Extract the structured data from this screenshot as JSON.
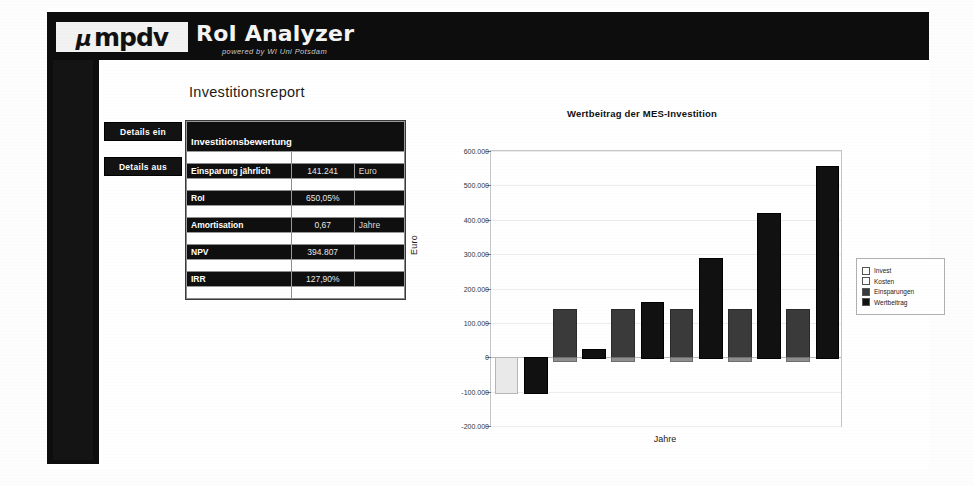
{
  "header": {
    "logo_mu": "µ",
    "logo_text": "mpdv",
    "app_title": "RoI Analyzer",
    "app_subtitle": "powered by WI Uni Potsdam"
  },
  "report": {
    "heading": "Investitionsreport"
  },
  "buttons": {
    "details_on": "Details ein",
    "details_off": "Details aus"
  },
  "table": {
    "title": "Investitionsbewertung",
    "rows": [
      {
        "label": "Einsparung jährlich",
        "value": "141.241",
        "unit": "Euro"
      },
      {
        "label": "RoI",
        "value": "650,05%",
        "unit": ""
      },
      {
        "label": "Amortisation",
        "value": "0,67",
        "unit": "Jahre"
      },
      {
        "label": "NPV",
        "value": "394.807",
        "unit": ""
      },
      {
        "label": "IRR",
        "value": "127,90%",
        "unit": ""
      }
    ]
  },
  "chart_data": {
    "type": "bar",
    "title": "Wertbeitrag der MES-Investition",
    "xlabel": "Jahre",
    "ylabel": "Euro",
    "ylim": [
      -200000,
      600000
    ],
    "ytick_values": [
      -200000,
      -100000,
      0,
      100000,
      200000,
      300000,
      400000,
      500000,
      600000
    ],
    "ytick_labels": [
      "-200.000",
      "-100.000",
      "0",
      "100.000",
      "200.000",
      "300.000",
      "400.000",
      "500.000",
      "600.000"
    ],
    "grid": true,
    "legend_position": "right",
    "categories": [
      "1",
      "2",
      "3",
      "4",
      "5",
      "6"
    ],
    "series": [
      {
        "name": "Invest",
        "color": "#e9e9e9",
        "values": [
          -100000,
          0,
          0,
          0,
          0,
          0
        ]
      },
      {
        "name": "Kosten",
        "color": "#8e8e8e",
        "values": [
          0,
          -8000,
          -8000,
          -8000,
          -8000,
          -8000
        ]
      },
      {
        "name": "Einsparungen",
        "color": "#3a3a3a",
        "values": [
          0,
          141241,
          141241,
          141241,
          141241,
          141241
        ]
      },
      {
        "name": "Wertbeitrag",
        "color": "#111111",
        "values": [
          -100000,
          25000,
          160000,
          290000,
          420000,
          555000
        ]
      }
    ]
  }
}
